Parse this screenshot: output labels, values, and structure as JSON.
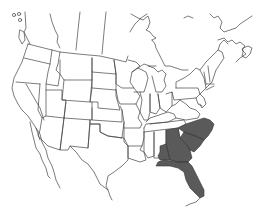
{
  "map": {
    "type": "range-map",
    "region": "North America (United States, southern Canada, northern Mexico)",
    "shaded_regions": [
      "North Carolina",
      "South Carolina",
      "Georgia",
      "Florida",
      "Alabama (southeastern portion)"
    ],
    "colors": {
      "background": "#ffffff",
      "border": "#444444",
      "range_fill": "#5a5a5a"
    }
  }
}
